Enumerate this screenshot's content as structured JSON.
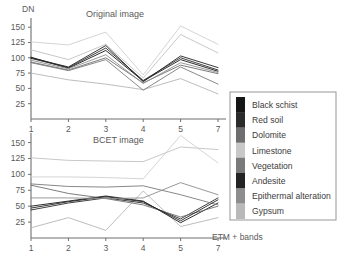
{
  "chart_data": [
    {
      "type": "line",
      "title": "Original image",
      "xlabel": "ETM + bands",
      "ylabel": "DN",
      "x": [
        1,
        2,
        3,
        4,
        5,
        7
      ],
      "xtick_labels": [
        "1",
        "2",
        "3",
        "4",
        "5",
        "7"
      ],
      "ytick_labels": [
        "25",
        "50",
        "75",
        "100",
        "125",
        "150"
      ],
      "yticks": [
        25,
        50,
        75,
        100,
        125,
        150
      ],
      "ylim": [
        0,
        165
      ],
      "grid": false,
      "legend_position": "right",
      "series": [
        {
          "name": "Black schist",
          "color": "#161616",
          "values": [
            101,
            83,
            112,
            62,
            97,
            78
          ]
        },
        {
          "name": "Red soil",
          "color": "#2b2b2b",
          "values": [
            99,
            84,
            116,
            63,
            100,
            80
          ]
        },
        {
          "name": "Dolomite",
          "color": "#6e6e6e",
          "values": [
            93,
            80,
            100,
            59,
            88,
            74
          ]
        },
        {
          "name": "Limestone",
          "color": "#c2c2c2",
          "values": [
            113,
            97,
            122,
            67,
            138,
            108
          ]
        },
        {
          "name": "Vegetation",
          "color": "#7a7a7a",
          "values": [
            92,
            79,
            97,
            47,
            85,
            57
          ]
        },
        {
          "name": "Andesite",
          "color": "#232323",
          "values": [
            100,
            85,
            120,
            61,
            103,
            84
          ]
        },
        {
          "name": "Epithermal alteration",
          "color": "#8d8d8d",
          "values": [
            96,
            82,
            105,
            58,
            92,
            76
          ]
        },
        {
          "name": "Gypsum",
          "color": "#cfcfcf",
          "values": [
            126,
            121,
            142,
            72,
            152,
            122
          ]
        }
      ],
      "extra_series": [
        {
          "name": "low-band",
          "color": "#b5b5b5",
          "values": [
            75,
            64,
            57,
            48,
            66,
            41
          ]
        }
      ]
    },
    {
      "type": "line",
      "title": "BCET image",
      "xlabel": "ETM + bands",
      "ylabel": "DN",
      "x": [
        1,
        2,
        3,
        4,
        5,
        7
      ],
      "xtick_labels": [
        "1",
        "2",
        "3",
        "4",
        "5",
        "7"
      ],
      "ytick_labels": [
        "25",
        "50",
        "75",
        "100",
        "125",
        "150"
      ],
      "yticks": [
        25,
        50,
        75,
        100,
        125,
        150
      ],
      "ylim": [
        0,
        165
      ],
      "grid": false,
      "legend_position": "right",
      "series": [
        {
          "name": "Black schist",
          "color": "#161616",
          "values": [
            50,
            58,
            66,
            58,
            24,
            55
          ]
        },
        {
          "name": "Red soil",
          "color": "#2b2b2b",
          "values": [
            44,
            55,
            63,
            55,
            30,
            63
          ]
        },
        {
          "name": "Dolomite",
          "color": "#6e6e6e",
          "values": [
            83,
            70,
            62,
            52,
            33,
            50
          ]
        },
        {
          "name": "Limestone",
          "color": "#c2c2c2",
          "values": [
            126,
            122,
            121,
            120,
            143,
            139
          ]
        },
        {
          "name": "Vegetation",
          "color": "#7a7a7a",
          "values": [
            85,
            81,
            80,
            82,
            68,
            52
          ]
        },
        {
          "name": "Andesite",
          "color": "#232323",
          "values": [
            47,
            57,
            65,
            57,
            27,
            60
          ]
        },
        {
          "name": "Epithermal alteration",
          "color": "#8d8d8d",
          "values": [
            63,
            63,
            62,
            63,
            87,
            68
          ]
        },
        {
          "name": "Gypsum",
          "color": "#cfcfcf",
          "values": [
            96,
            96,
            95,
            93,
            161,
            118
          ]
        }
      ],
      "extra_series": [
        {
          "name": "low-band",
          "color": "#b5b5b5",
          "values": [
            16,
            32,
            12,
            74,
            18,
            32
          ]
        }
      ]
    }
  ],
  "legend": {
    "items": [
      {
        "label": "Black schist",
        "color": "#161616"
      },
      {
        "label": "Red soil",
        "color": "#2b2b2b"
      },
      {
        "label": "Dolomite",
        "color": "#6e6e6e"
      },
      {
        "label": "Limestone",
        "color": "#c8c8c8"
      },
      {
        "label": "Vegetation",
        "color": "#7a7a7a"
      },
      {
        "label": "Andesite",
        "color": "#232323"
      },
      {
        "label": "Epithermal alteration",
        "color": "#8d8d8d"
      },
      {
        "label": "Gypsum",
        "color": "#b9b9b9"
      }
    ]
  },
  "axes": {
    "y_label": "DN",
    "x_label": "ETM + bands"
  },
  "panels": {
    "top_title": "Original image",
    "bottom_title": "BCET image"
  }
}
